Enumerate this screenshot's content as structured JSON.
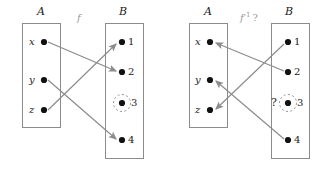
{
  "figure": {
    "title": "",
    "panels": [
      {
        "id": "left-panel",
        "map_label": "f",
        "map_label_sup": "",
        "map_label_q": "",
        "set_a_label": "A",
        "set_b_label": "B",
        "a_elements": [
          "x",
          "y",
          "z"
        ],
        "b_elements": [
          "1",
          "2",
          "3",
          "4"
        ],
        "highlighted_b_element": "3",
        "question_mark": "",
        "arrows": [
          {
            "from": "x",
            "to": "2"
          },
          {
            "from": "y",
            "to": "4"
          },
          {
            "from": "z",
            "to": "1"
          }
        ]
      },
      {
        "id": "right-panel",
        "map_label": "f",
        "map_label_sup": "-1",
        "map_label_q": "?",
        "set_a_label": "A",
        "set_b_label": "B",
        "a_elements": [
          "x",
          "y",
          "z"
        ],
        "b_elements": [
          "1",
          "2",
          "3",
          "4"
        ],
        "highlighted_b_element": "3",
        "question_mark": "?",
        "arrows": [
          {
            "from": "1",
            "to": "z"
          },
          {
            "from": "2",
            "to": "x"
          },
          {
            "from": "4",
            "to": "y"
          }
        ]
      }
    ],
    "colors": {
      "box_stroke": "#8c8c8c",
      "arrow": "#8c8c8c",
      "node": "#111111",
      "text": "#1a1a1a",
      "dashed_circle": "#9a9a9a",
      "background": "#ffffff"
    }
  }
}
